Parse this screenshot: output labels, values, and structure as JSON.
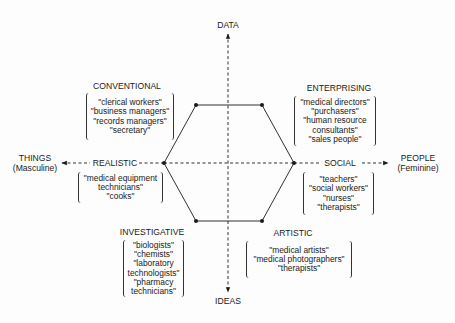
{
  "diagram": {
    "type": "hexagon-model",
    "axes": {
      "top": {
        "label": "DATA"
      },
      "bottom": {
        "label": "IDEAS"
      },
      "left": {
        "label": "THINGS",
        "sublabel": "(Masculine)"
      },
      "right": {
        "label": "PEOPLE",
        "sublabel": "(Feminine)"
      }
    },
    "types": [
      {
        "id": "conventional",
        "label": "CONVENTIONAL",
        "position": "top-left",
        "examples": [
          "\"clerical workers\"",
          "\"business managers\"",
          "\"records managers\"",
          "\"secretary\""
        ]
      },
      {
        "id": "enterprising",
        "label": "ENTERPRISING",
        "position": "top-right",
        "examples": [
          "\"medical directors\"",
          "\"purchasers\"",
          "\"human resource",
          "consultants\"",
          "\"sales people\""
        ]
      },
      {
        "id": "realistic",
        "label": "REALISTIC",
        "position": "left",
        "examples": [
          "\"medical equipment",
          "technicians\"",
          "\"cooks\""
        ]
      },
      {
        "id": "social",
        "label": "SOCIAL",
        "position": "right",
        "examples": [
          "\"teachers\"",
          "\"social workers\"",
          "\"nurses\"",
          "\"therapists\""
        ]
      },
      {
        "id": "investigative",
        "label": "INVESTIGATIVE",
        "position": "bottom-left",
        "examples": [
          "\"biologists\"",
          "\"chemists\"",
          "\"laboratory",
          "technologists\"",
          "\"pharmacy",
          "technicians\""
        ]
      },
      {
        "id": "artistic",
        "label": "ARTISTIC",
        "position": "bottom-right",
        "examples": [
          "\"medical artists\"",
          "\"medical photographers\"",
          "\"therapists\""
        ]
      }
    ],
    "colors": {
      "ink": "#1a1a1a",
      "background": "#fdfdfd"
    }
  }
}
